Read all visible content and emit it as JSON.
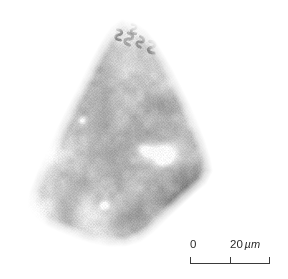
{
  "figure": {
    "type": "micrograph",
    "modality": "light-micrograph-halftone",
    "background_color": "#ffffff",
    "caption_text": "",
    "specimen": {
      "name": "triangular-microfossil-fragment",
      "description": "Wedge-shaped siliceous specimen with rows of S-shaped pore structures",
      "shape": "triangular",
      "tone_color_dark": "#2e2e2e",
      "tone_color_mid": "#8a8a8a",
      "tone_color_light": "#d2d2d2"
    }
  },
  "scale_bar": {
    "name": "scale-bar",
    "start_label": "0",
    "end_value": "20",
    "end_unit": "µm",
    "end_label": "20 µm",
    "ticks": 3,
    "bar_color": "#3a3a3a",
    "text_color": "#2b2b2b"
  },
  "chart_data": {
    "type": "heatmap",
    "title": "",
    "xlabel": "",
    "ylabel": "",
    "scale": {
      "from": 0,
      "to": 20,
      "unit": "µm",
      "bar_length_px": 80
    }
  }
}
